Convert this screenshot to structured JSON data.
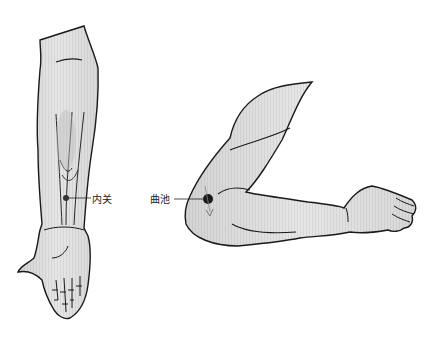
{
  "figure": {
    "panels": [
      {
        "id": "forearm-palm-view",
        "acupoint": {
          "name": "内关",
          "marker_color": "#333333"
        }
      },
      {
        "id": "bent-arm-side-view",
        "acupoint": {
          "name": "曲池",
          "marker_color": "#1a1a1a"
        }
      }
    ],
    "colors": {
      "skin_fill": "#e4e4e4",
      "skin_shade": "#cfcfcf",
      "outline": "#1a1a1a",
      "tendon": "#333333",
      "label_text": "#222222"
    }
  }
}
